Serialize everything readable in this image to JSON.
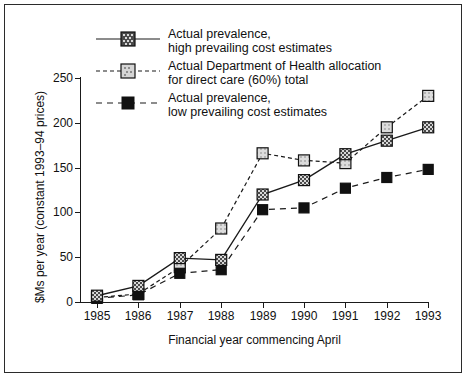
{
  "chart_data": {
    "type": "line",
    "title": "",
    "xlabel": "Financial year commencing April",
    "ylabel": "$Ms per year (constant 1993–94 prices)",
    "categories": [
      "1985",
      "1986",
      "1987",
      "1988",
      "1989",
      "1990",
      "1991",
      "1992",
      "1993"
    ],
    "x": [
      1985,
      1986,
      1987,
      1988,
      1989,
      1990,
      1991,
      1992,
      1993
    ],
    "xlim": [
      1985,
      1993
    ],
    "ylim": [
      0,
      250
    ],
    "yticks": [
      0,
      50,
      100,
      150,
      200,
      250
    ],
    "ytick_labels": [
      "0",
      "50",
      "100",
      "150",
      "200",
      "250"
    ],
    "grid": false,
    "legend_position": "top-center-inside",
    "series": [
      {
        "name": "Actual prevalence, high prevailing cost estimates",
        "name_line1": "Actual prevalence,",
        "name_line2": "high prevailing cost estimates",
        "marker": "filled-dark-checkered-square",
        "linestyle": "solid",
        "color": "#3a3a3a",
        "values": [
          7,
          18,
          49,
          47,
          120,
          136,
          165,
          180,
          195
        ]
      },
      {
        "name": "Actual Department of Health allocation for direct care (60%) total",
        "name_line1": "Actual Department of Health allocation",
        "name_line2": "for direct care (60%) total",
        "marker": "light-gray-square",
        "linestyle": "dotted",
        "color": "#cfcfcf",
        "values": [
          5,
          9,
          39,
          82,
          166,
          158,
          155,
          195,
          230
        ]
      },
      {
        "name": "Actual prevalence, low prevailing cost estimates",
        "name_line1": "Actual prevalence,",
        "name_line2": "low prevailing cost estimates",
        "marker": "solid-black-square",
        "linestyle": "dashed",
        "color": "#111111",
        "values": [
          4,
          8,
          32,
          36,
          103,
          105,
          127,
          139,
          148
        ]
      }
    ]
  },
  "axes": {
    "y_title": "$Ms per year (constant 1993–94 prices)",
    "x_title": "Financial year commencing April"
  },
  "colors": {
    "frame": "#2b2b2b",
    "axis": "#1a1a1a",
    "series_high": "#3a3a3a",
    "series_allocation": "#cfcfcf",
    "series_low": "#111111",
    "background": "#ffffff"
  }
}
